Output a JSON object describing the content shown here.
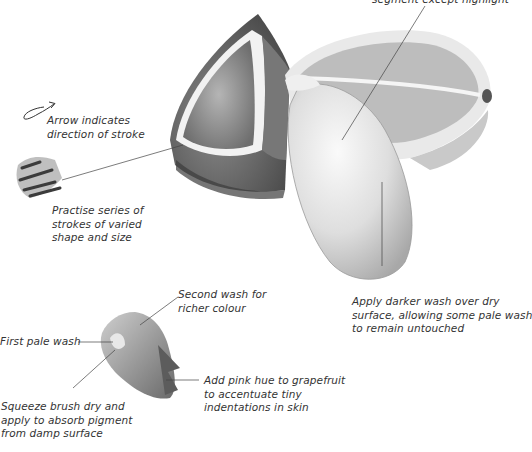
{
  "annotations": {
    "top_right": "segment except highlight",
    "arrow": [
      "Arrow indicates",
      "direction of stroke"
    ],
    "practise": [
      "Practise series of",
      "strokes of varied",
      "shape and size"
    ],
    "darker_wash": [
      "Apply darker wash over dry",
      "surface, allowing some pale wash",
      "to remain untouched"
    ],
    "second_wash": [
      "Second wash for",
      "richer colour"
    ],
    "first_wash": [
      "First pale wash"
    ],
    "pink_hue": [
      "Add pink hue to grapefruit",
      "to accentuate tiny",
      "indentations in skin"
    ],
    "squeeze": [
      "Squeeze brush dry and",
      "apply to absorb pigment",
      "from damp surface"
    ]
  },
  "illustration": {
    "subject": "grapefruit segments and halves (pencil/watercolour study)",
    "palette": {
      "ink": "#333333",
      "shade_dark": "#555555",
      "shade_mid": "#9a9a9a",
      "shade_light": "#d8d8d8"
    }
  }
}
